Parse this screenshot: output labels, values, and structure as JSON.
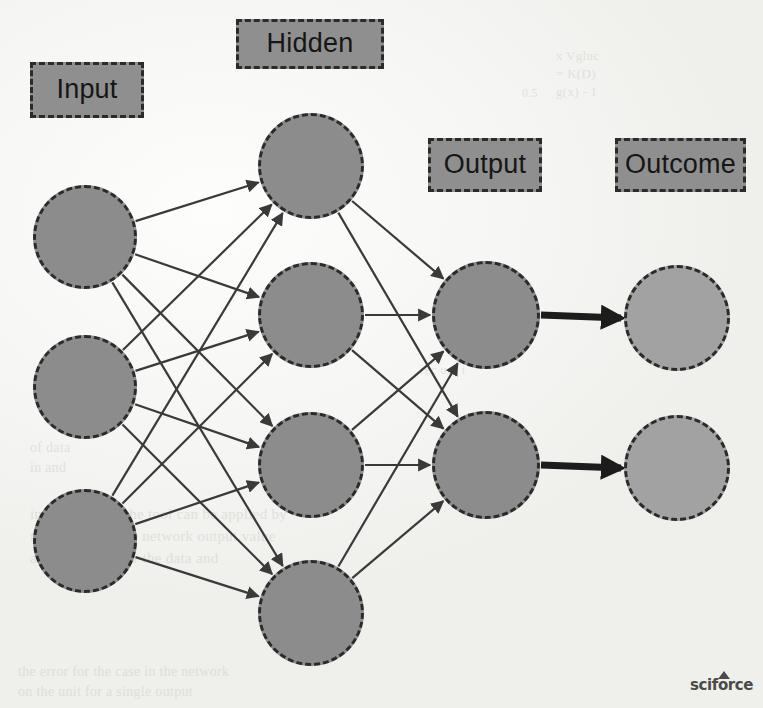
{
  "diagram": {
    "background_color": "#f2f2f0",
    "node_fill_color": "#8c8c8c",
    "outcome_fill_color": "#a2a2a2",
    "node_border_color": "#2b2b2b",
    "edge_color": "#3a3a3a",
    "label_fill_color": "#8f8f8f"
  },
  "labels": [
    {
      "id": "input",
      "text": "Input",
      "x": 30,
      "y": 62,
      "w": 114,
      "h": 56
    },
    {
      "id": "hidden",
      "text": "Hidden",
      "x": 236,
      "y": 19,
      "w": 148,
      "h": 50
    },
    {
      "id": "output",
      "text": "Output",
      "x": 428,
      "y": 138,
      "w": 114,
      "h": 54
    },
    {
      "id": "outcome",
      "text": "Outcome",
      "x": 615,
      "y": 138,
      "w": 131,
      "h": 54
    }
  ],
  "layers": [
    {
      "id": "input",
      "name": "Input",
      "node_count": 3,
      "nodes": [
        {
          "id": "i1",
          "cx": 85,
          "cy": 237,
          "r": 52
        },
        {
          "id": "i2",
          "cx": 85,
          "cy": 387,
          "r": 52
        },
        {
          "id": "i3",
          "cx": 85,
          "cy": 541,
          "r": 52
        }
      ]
    },
    {
      "id": "hidden",
      "name": "Hidden",
      "node_count": 4,
      "nodes": [
        {
          "id": "h1",
          "cx": 311,
          "cy": 166,
          "r": 53
        },
        {
          "id": "h2",
          "cx": 311,
          "cy": 315,
          "r": 53
        },
        {
          "id": "h3",
          "cx": 311,
          "cy": 465,
          "r": 53
        },
        {
          "id": "h4",
          "cx": 311,
          "cy": 613,
          "r": 53
        }
      ]
    },
    {
      "id": "output",
      "name": "Output",
      "node_count": 2,
      "nodes": [
        {
          "id": "o1",
          "cx": 486,
          "cy": 315,
          "r": 54
        },
        {
          "id": "o2",
          "cx": 486,
          "cy": 465,
          "r": 54
        }
      ]
    },
    {
      "id": "outcome",
      "name": "Outcome",
      "node_count": 2,
      "nodes": [
        {
          "id": "c1",
          "cx": 677,
          "cy": 318,
          "r": 53
        },
        {
          "id": "c2",
          "cx": 677,
          "cy": 468,
          "r": 53
        }
      ]
    }
  ],
  "edges": {
    "input_to_hidden": [
      [
        "i1",
        "h1"
      ],
      [
        "i1",
        "h2"
      ],
      [
        "i1",
        "h3"
      ],
      [
        "i1",
        "h4"
      ],
      [
        "i2",
        "h1"
      ],
      [
        "i2",
        "h2"
      ],
      [
        "i2",
        "h3"
      ],
      [
        "i2",
        "h4"
      ],
      [
        "i3",
        "h1"
      ],
      [
        "i3",
        "h2"
      ],
      [
        "i3",
        "h3"
      ],
      [
        "i3",
        "h4"
      ]
    ],
    "hidden_to_output": [
      [
        "h1",
        "o1"
      ],
      [
        "h1",
        "o2"
      ],
      [
        "h2",
        "o1"
      ],
      [
        "h2",
        "o2"
      ],
      [
        "h3",
        "o1"
      ],
      [
        "h3",
        "o2"
      ],
      [
        "h4",
        "o1"
      ],
      [
        "h4",
        "o2"
      ]
    ],
    "output_to_outcome": [
      [
        "o1",
        "c1"
      ],
      [
        "o2",
        "c2"
      ]
    ],
    "thin_width": 2.2,
    "thick_width": 7
  },
  "watermark": {
    "text": "sciforce",
    "x": 690,
    "y": 676
  },
  "ghost_text": [
    {
      "text": "x Vgluc",
      "x": 556,
      "y": 48,
      "size": 13
    },
    {
      "text": "= K(D)",
      "x": 556,
      "y": 66,
      "size": 13
    },
    {
      "text": "g(x) - 1",
      "x": 556,
      "y": 84,
      "size": 13
    },
    {
      "text": "and",
      "x": 340,
      "y": 22,
      "size": 12
    },
    {
      "text": "0.5",
      "x": 522,
      "y": 86,
      "size": 12
    },
    {
      "text": "rec unt i",
      "x": 420,
      "y": 362,
      "size": 13
    },
    {
      "text": "in the process,  the tool can be applied by",
      "x": 30,
      "y": 506,
      "size": 15
    },
    {
      "text": "modelled and the network output value",
      "x": 30,
      "y": 528,
      "size": 15
    },
    {
      "text": "an expression for the data and",
      "x": 30,
      "y": 550,
      "size": 15
    },
    {
      "text": "the error for the case in the network",
      "x": 18,
      "y": 664,
      "size": 14
    },
    {
      "text": "on the unit for a single output",
      "x": 18,
      "y": 684,
      "size": 14
    },
    {
      "text": "of data",
      "x": 30,
      "y": 440,
      "size": 14
    },
    {
      "text": "in and",
      "x": 30,
      "y": 460,
      "size": 14
    }
  ]
}
